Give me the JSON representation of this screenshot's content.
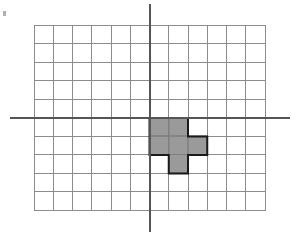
{
  "figure": {
    "title": "",
    "canvas": {
      "width": 301,
      "height": 250,
      "background": "#ffffff"
    }
  },
  "chart_data": {
    "type": "heatmap",
    "title": "",
    "subtitle": "",
    "xlabel": "",
    "ylabel": "",
    "grid": true,
    "legend_position": "none",
    "grid_spec": {
      "columns": 12,
      "rows": 10,
      "x_left_px": 34,
      "y_top_px": 25,
      "cell_width_px": 19.25,
      "cell_height_px": 18.5,
      "origin_col_index": 6,
      "origin_row_index": 5,
      "xlim": [
        -6,
        6
      ],
      "ylim": [
        -5,
        5
      ],
      "x_tick_labels": [],
      "y_tick_labels": []
    },
    "axes": {
      "x_axis": {
        "name": "x-axis",
        "orientation": "horizontal",
        "y_px": 118,
        "x_start_px": 10,
        "x_end_px": 290,
        "color": "#555555",
        "width_px": 2
      },
      "y_axis": {
        "name": "y-axis",
        "orientation": "vertical",
        "x_px": 149.5,
        "y_start_px": 4,
        "y_end_px": 232,
        "color": "#555555",
        "width_px": 2
      }
    },
    "grid_style": {
      "line_color": "#8c8c8c",
      "line_width_px": 1,
      "border_color": "#8c8c8c",
      "cell_fill": "#ffffff"
    },
    "shaded_region": {
      "name": "shaded-polyomino",
      "fill_color": "#9a9a9a",
      "stroke_color": "#1a1a1a",
      "stroke_width_px": 2,
      "cell_count": 6,
      "cells": [
        {
          "col": 6,
          "row": 5,
          "grid_x": 0,
          "grid_y": -1
        },
        {
          "col": 7,
          "row": 5,
          "grid_x": 1,
          "grid_y": -1
        },
        {
          "col": 6,
          "row": 6,
          "grid_x": 0,
          "grid_y": -2
        },
        {
          "col": 7,
          "row": 6,
          "grid_x": 1,
          "grid_y": -2
        },
        {
          "col": 8,
          "row": 6,
          "grid_x": 2,
          "grid_y": -2
        },
        {
          "col": 7,
          "row": 7,
          "grid_x": 1,
          "grid_y": -3
        }
      ],
      "outline_points_px": "149.5,118 188,118 188,136.5 207.25,136.5 207.25,155 188,155 188,173.5 168.75,173.5 168.75,155 149.5,155"
    },
    "marks": [
      {
        "name": "corner-tick-mark",
        "type": "small-dash",
        "x_px": 3,
        "y_px": 11,
        "width_px": 3,
        "height_px": 5,
        "color": "#b0b0b0"
      }
    ]
  }
}
